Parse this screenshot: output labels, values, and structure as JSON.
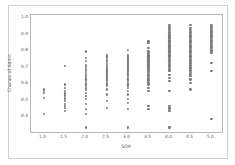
{
  "chart_data": {
    "type": "scatter",
    "title": "",
    "xlabel": "SOP",
    "ylabel": "Chance of Admit",
    "xlim": [
      0.7,
      5.3
    ],
    "ylim": [
      0.3,
      1.02
    ],
    "grid": false,
    "legend": null,
    "marker_color": "#7b7b7b",
    "frame_color": "#b8b8b8",
    "xticks": [
      "1.0",
      "1.5",
      "2.0",
      "2.5",
      "3.0",
      "3.5",
      "4.0",
      "4.5",
      "5.0"
    ],
    "xtick_values": [
      1.0,
      1.5,
      2.0,
      2.5,
      3.0,
      3.5,
      4.0,
      4.5,
      5.0
    ],
    "yticks": [
      "0.4",
      "0.5",
      "0.6",
      "0.7",
      "0.8",
      "0.9",
      "1.0"
    ],
    "ytick_values": [
      0.4,
      0.5,
      0.6,
      0.7,
      0.8,
      0.9,
      1.0
    ],
    "series": [
      {
        "name": "Applicants",
        "x": [
          1.0,
          1.0,
          1.0,
          1.0,
          1.0,
          1.5,
          1.5,
          1.5,
          1.5,
          1.5,
          1.5,
          1.5,
          1.5,
          1.5,
          1.5,
          1.5,
          1.5,
          1.5,
          1.5,
          2.0,
          2.0,
          2.0,
          2.0,
          2.0,
          2.0,
          2.0,
          2.0,
          2.0,
          2.0,
          2.0,
          2.0,
          2.0,
          2.0,
          2.0,
          2.0,
          2.0,
          2.0,
          2.0,
          2.0,
          2.0,
          2.0,
          2.0,
          2.0,
          2.0,
          2.0,
          2.5,
          2.5,
          2.5,
          2.5,
          2.5,
          2.5,
          2.5,
          2.5,
          2.5,
          2.5,
          2.5,
          2.5,
          2.5,
          2.5,
          2.5,
          2.5,
          2.5,
          2.5,
          2.5,
          2.5,
          2.5,
          2.5,
          2.5,
          2.5,
          2.5,
          2.5,
          2.5,
          2.5,
          2.5,
          2.5,
          2.5,
          3.0,
          3.0,
          3.0,
          3.0,
          3.0,
          3.0,
          3.0,
          3.0,
          3.0,
          3.0,
          3.0,
          3.0,
          3.0,
          3.0,
          3.0,
          3.0,
          3.0,
          3.0,
          3.0,
          3.0,
          3.0,
          3.0,
          3.0,
          3.0,
          3.0,
          3.0,
          3.0,
          3.0,
          3.0,
          3.0,
          3.0,
          3.0,
          3.0,
          3.0,
          3.0,
          3.0,
          3.0,
          3.0,
          3.0,
          3.5,
          3.5,
          3.5,
          3.5,
          3.5,
          3.5,
          3.5,
          3.5,
          3.5,
          3.5,
          3.5,
          3.5,
          3.5,
          3.5,
          3.5,
          3.5,
          3.5,
          3.5,
          3.5,
          3.5,
          3.5,
          3.5,
          3.5,
          3.5,
          3.5,
          3.5,
          3.5,
          3.5,
          3.5,
          3.5,
          3.5,
          3.5,
          3.5,
          3.5,
          3.5,
          3.5,
          3.5,
          3.5,
          4.0,
          4.0,
          4.0,
          4.0,
          4.0,
          4.0,
          4.0,
          4.0,
          4.0,
          4.0,
          4.0,
          4.0,
          4.0,
          4.0,
          4.0,
          4.0,
          4.0,
          4.0,
          4.0,
          4.0,
          4.0,
          4.0,
          4.0,
          4.0,
          4.0,
          4.0,
          4.0,
          4.0,
          4.0,
          4.0,
          4.0,
          4.0,
          4.0,
          4.0,
          4.0,
          4.0,
          4.0,
          4.0,
          4.0,
          4.0,
          4.0,
          4.0,
          4.0,
          4.0,
          4.5,
          4.5,
          4.5,
          4.5,
          4.5,
          4.5,
          4.5,
          4.5,
          4.5,
          4.5,
          4.5,
          4.5,
          4.5,
          4.5,
          4.5,
          4.5,
          4.5,
          4.5,
          4.5,
          4.5,
          4.5,
          4.5,
          4.5,
          4.5,
          4.5,
          4.5,
          4.5,
          4.5,
          4.5,
          4.5,
          4.5,
          4.5,
          4.5,
          4.5,
          4.5,
          4.5,
          5.0,
          5.0,
          5.0,
          5.0,
          5.0,
          5.0,
          5.0,
          5.0,
          5.0,
          5.0,
          5.0,
          5.0,
          5.0,
          5.0,
          5.0,
          5.0,
          5.0,
          5.0,
          5.0,
          5.0,
          5.0,
          5.0,
          5.0
        ],
        "y": [
          0.57,
          0.56,
          0.55,
          0.52,
          0.42,
          0.71,
          0.6,
          0.58,
          0.56,
          0.55,
          0.54,
          0.53,
          0.52,
          0.51,
          0.5,
          0.48,
          0.47,
          0.46,
          0.44,
          0.8,
          0.76,
          0.74,
          0.72,
          0.71,
          0.7,
          0.69,
          0.68,
          0.67,
          0.66,
          0.65,
          0.64,
          0.63,
          0.62,
          0.61,
          0.6,
          0.59,
          0.58,
          0.57,
          0.55,
          0.53,
          0.51,
          0.48,
          0.45,
          0.42,
          0.34,
          0.78,
          0.77,
          0.76,
          0.75,
          0.74,
          0.73,
          0.72,
          0.71,
          0.7,
          0.7,
          0.69,
          0.69,
          0.68,
          0.68,
          0.67,
          0.67,
          0.66,
          0.66,
          0.65,
          0.65,
          0.64,
          0.64,
          0.63,
          0.62,
          0.61,
          0.6,
          0.59,
          0.57,
          0.54,
          0.5,
          0.46,
          0.81,
          0.78,
          0.77,
          0.76,
          0.76,
          0.75,
          0.75,
          0.74,
          0.74,
          0.73,
          0.73,
          0.72,
          0.72,
          0.71,
          0.71,
          0.7,
          0.7,
          0.69,
          0.69,
          0.68,
          0.68,
          0.67,
          0.67,
          0.66,
          0.66,
          0.65,
          0.64,
          0.63,
          0.62,
          0.61,
          0.6,
          0.59,
          0.58,
          0.56,
          0.54,
          0.51,
          0.49,
          0.45,
          0.34,
          0.86,
          0.85,
          0.82,
          0.8,
          0.79,
          0.78,
          0.78,
          0.77,
          0.77,
          0.76,
          0.76,
          0.75,
          0.75,
          0.74,
          0.74,
          0.73,
          0.73,
          0.72,
          0.72,
          0.71,
          0.71,
          0.7,
          0.7,
          0.69,
          0.69,
          0.68,
          0.67,
          0.66,
          0.65,
          0.64,
          0.63,
          0.62,
          0.61,
          0.6,
          0.58,
          0.56,
          0.47,
          0.45,
          0.96,
          0.95,
          0.94,
          0.93,
          0.92,
          0.91,
          0.9,
          0.89,
          0.88,
          0.88,
          0.87,
          0.86,
          0.86,
          0.85,
          0.84,
          0.84,
          0.83,
          0.82,
          0.82,
          0.81,
          0.8,
          0.8,
          0.79,
          0.78,
          0.78,
          0.77,
          0.76,
          0.75,
          0.74,
          0.73,
          0.72,
          0.71,
          0.7,
          0.69,
          0.68,
          0.66,
          0.64,
          0.62,
          0.56,
          0.47,
          0.46,
          0.45,
          0.44,
          0.34,
          0.96,
          0.94,
          0.93,
          0.92,
          0.91,
          0.9,
          0.89,
          0.88,
          0.87,
          0.86,
          0.85,
          0.84,
          0.83,
          0.82,
          0.81,
          0.8,
          0.79,
          0.78,
          0.77,
          0.76,
          0.75,
          0.74,
          0.73,
          0.73,
          0.72,
          0.71,
          0.7,
          0.7,
          0.69,
          0.68,
          0.67,
          0.66,
          0.65,
          0.63,
          0.61,
          0.57,
          0.96,
          0.95,
          0.94,
          0.93,
          0.92,
          0.92,
          0.91,
          0.9,
          0.9,
          0.89,
          0.88,
          0.87,
          0.86,
          0.85,
          0.84,
          0.83,
          0.82,
          0.81,
          0.8,
          0.79,
          0.73,
          0.68,
          0.39
        ]
      }
    ]
  }
}
